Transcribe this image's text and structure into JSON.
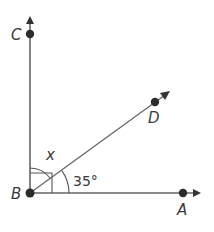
{
  "diagram": {
    "points": {
      "A": {
        "label": "A"
      },
      "B": {
        "label": "B"
      },
      "C": {
        "label": "C"
      },
      "D": {
        "label": "D"
      }
    },
    "angles": {
      "unknown_label": "x",
      "known_label": "35°"
    },
    "rays": [
      "BA",
      "BC",
      "BD"
    ],
    "colors": {
      "line": "#555555",
      "point": "#2b2b2b",
      "text": "#3a3a3a"
    }
  }
}
